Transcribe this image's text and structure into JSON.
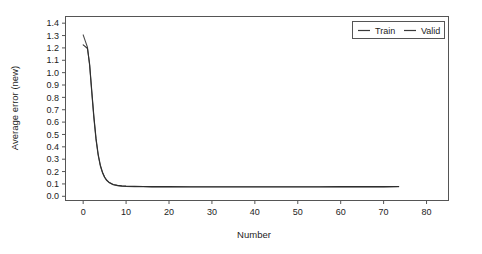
{
  "chart_data": {
    "type": "line",
    "title": "",
    "xlabel": "Number",
    "ylabel": "Average error (new)",
    "xlim": [
      -4,
      85
    ],
    "ylim": [
      -0.03,
      1.45
    ],
    "grid": false,
    "legend_position": "top-right",
    "xticks": [
      "0",
      "10",
      "20",
      "30",
      "40",
      "50",
      "60",
      "70",
      "80"
    ],
    "xtick_values": [
      0,
      10,
      20,
      30,
      40,
      50,
      60,
      70,
      80
    ],
    "yticks": [
      "0.0",
      "0.1",
      "0.2",
      "0.3",
      "0.4",
      "0.5",
      "0.6",
      "0.7",
      "0.8",
      "0.9",
      "1.0",
      "1.1",
      "1.2",
      "1.3",
      "1.4"
    ],
    "ytick_values": [
      0.0,
      0.1,
      0.2,
      0.3,
      0.4,
      0.5,
      0.6,
      0.7,
      0.8,
      0.9,
      1.0,
      1.1,
      1.2,
      1.3,
      1.4
    ],
    "series": [
      {
        "name": "Train",
        "color": "#4a4a4a",
        "x": [
          0,
          0.5,
          1,
          1.5,
          2,
          2.5,
          3,
          3.5,
          4,
          4.5,
          5,
          5.5,
          6,
          7,
          8,
          9,
          10,
          12,
          14,
          16,
          18,
          20,
          25,
          30,
          35,
          40,
          45,
          50,
          55,
          60,
          65,
          70,
          73.5
        ],
        "y": [
          1.305,
          1.255,
          1.205,
          1.06,
          0.84,
          0.63,
          0.455,
          0.33,
          0.245,
          0.19,
          0.152,
          0.127,
          0.112,
          0.094,
          0.086,
          0.082,
          0.08,
          0.078,
          0.077,
          0.0765,
          0.076,
          0.0755,
          0.0752,
          0.075,
          0.075,
          0.075,
          0.075,
          0.0752,
          0.0755,
          0.0758,
          0.076,
          0.0765,
          0.077
        ]
      },
      {
        "name": "Valid",
        "color": "#2e2e2e",
        "x": [
          0,
          0.5,
          1,
          1.5,
          2,
          2.5,
          3,
          3.5,
          4,
          4.5,
          5,
          5.5,
          6,
          7,
          8,
          9,
          10,
          12,
          14,
          16,
          18,
          20,
          25,
          30,
          35,
          40,
          45,
          50,
          55,
          60,
          65,
          70,
          73.5
        ],
        "y": [
          1.225,
          1.21,
          1.195,
          1.07,
          0.855,
          0.645,
          0.468,
          0.34,
          0.252,
          0.195,
          0.156,
          0.13,
          0.114,
          0.096,
          0.088,
          0.084,
          0.082,
          0.08,
          0.079,
          0.0785,
          0.078,
          0.0778,
          0.0775,
          0.0772,
          0.077,
          0.077,
          0.077,
          0.0772,
          0.0775,
          0.0778,
          0.078,
          0.0785,
          0.079
        ]
      }
    ],
    "legend": [
      {
        "label": "Train",
        "color": "#4a4a4a"
      },
      {
        "label": "Valid",
        "color": "#2e2e2e"
      }
    ]
  },
  "figure": {
    "background_color": "#ffffff",
    "frame_color": "#555555"
  }
}
